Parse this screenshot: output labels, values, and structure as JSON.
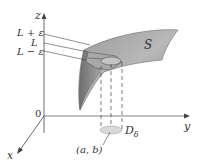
{
  "axes": {
    "z_label": "z",
    "y_label": "y",
    "x_label": "x",
    "origin_label": "0"
  },
  "levels": {
    "upper": "L + ε",
    "middle": "L",
    "lower": "L − ε"
  },
  "surface": {
    "label": "S",
    "fill": "#8a8a8a"
  },
  "point": {
    "label": "(a, b)"
  },
  "disk": {
    "label": "D",
    "subscript": "δ",
    "fill": "#d9d9d9"
  },
  "colors": {
    "axis": "#444444",
    "surface_light": "#b5b5b5",
    "surface_dark": "#6a6a6a",
    "text": "#333333"
  }
}
